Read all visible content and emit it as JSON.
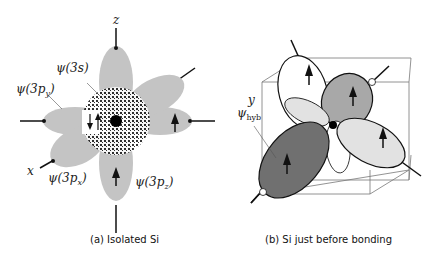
{
  "panel_a": {
    "caption": "(a) Isolated Si",
    "axis_labels": {
      "z": "z",
      "x": "x",
      "y": "y"
    },
    "orbital_labels": {
      "s": "ψ(3s)",
      "py": "ψ(3p",
      "py_sub": "y",
      "px": "ψ(3p",
      "px_sub": "x",
      "pz": "ψ(3p",
      "pz_sub": "z",
      "close": ")"
    },
    "colors": {
      "lobe": "#c4c4c4",
      "nucleus": "#000000",
      "dots": "#111111"
    }
  },
  "panel_b": {
    "caption": "(b) Si just before bonding",
    "hyb_label": "ψ",
    "hyb_sub": "hyb",
    "colors": {
      "dark_lobe": "#707070",
      "mid_lobe": "#a8a8a8",
      "light_lobe": "#e2e2e2",
      "cube": "#777777"
    }
  }
}
